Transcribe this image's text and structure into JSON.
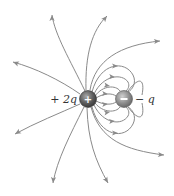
{
  "diagram": {
    "colors": {
      "line": "#8a8a8a",
      "positive_charge": "#5a5a5a",
      "negative_charge": "#8f8f8f",
      "label": "#333333"
    },
    "charges": [
      {
        "id": "positive",
        "sign": "+",
        "label": "+2q",
        "cx": 88,
        "cy": 99,
        "r": 8
      },
      {
        "id": "negative",
        "sign": "−",
        "label": "−q",
        "cx": 124,
        "cy": 99,
        "r": 8
      }
    ],
    "labels": {
      "positive": "+ 2q",
      "negative": "− q"
    },
    "outgoing_lines": [
      {
        "name": "up-left",
        "d": "M85,91 C70,60 55,35 52,15",
        "arrow": [
          52,
          15,
          -90
        ]
      },
      {
        "name": "left-up",
        "d": "M80,94 C60,80 35,68 13,62",
        "arrow": [
          13,
          62,
          -160
        ]
      },
      {
        "name": "up-right",
        "d": "M86,90 C85,55 92,30 107,16",
        "arrow": [
          107,
          16,
          -50
        ]
      },
      {
        "name": "right-up",
        "d": "M90,90 C95,60 120,45 160,41",
        "arrow": [
          160,
          41,
          -5
        ]
      },
      {
        "name": "left-down",
        "d": "M80,104 C60,113 35,123 15,134",
        "arrow": [
          15,
          134,
          150
        ]
      },
      {
        "name": "down-left",
        "d": "M84,107 C70,135 57,160 53,183",
        "arrow": [
          53,
          183,
          95
        ]
      },
      {
        "name": "down-right",
        "d": "M87,108 C88,140 95,160 108,183",
        "arrow": [
          108,
          183,
          60
        ]
      },
      {
        "name": "right-down",
        "d": "M91,107 C100,140 125,150 164,155",
        "arrow": [
          164,
          155,
          5
        ]
      }
    ],
    "connecting_lines": [
      {
        "name": "outer-top",
        "d": "M92,92 C100,62 125,60 133,75 C137,83 132,90 128,92",
        "arrow": [
          118,
          66,
          0
        ]
      },
      {
        "name": "mid-top",
        "d": "M94,94 C103,75 122,73 128,82 C130,86 128,89 126,91",
        "arrow": [
          115,
          77,
          5
        ]
      },
      {
        "name": "inner-top",
        "d": "M95,96 C103,85 116,85 120,91",
        "arrow": [
          110,
          86,
          10
        ]
      },
      {
        "name": "innermost-top",
        "d": "M96,98 C104,93 112,93 116,96",
        "arrow": [
          108,
          94,
          5
        ]
      },
      {
        "name": "innermost-bottom",
        "d": "M96,101 C104,105 112,105 116,102",
        "arrow": [
          108,
          104,
          -5
        ]
      },
      {
        "name": "inner-bottom",
        "d": "M95,103 C103,113 116,113 120,107",
        "arrow": [
          110,
          112,
          -10
        ]
      },
      {
        "name": "mid-bottom",
        "d": "M94,105 C103,124 122,126 128,116 C130,112 128,109 126,107",
        "arrow": [
          115,
          121,
          -5
        ]
      },
      {
        "name": "outer-bottom",
        "d": "M92,107 C100,137 125,140 133,124 C137,116 132,109 128,107",
        "arrow": [
          118,
          133,
          0
        ]
      }
    ],
    "far_right_lines": [
      {
        "name": "right-outer-top",
        "d": "M128,91 C140,75 145,80 142,95"
      },
      {
        "name": "right-outer-bottom",
        "d": "M128,107 C140,123 145,118 142,103"
      }
    ]
  }
}
